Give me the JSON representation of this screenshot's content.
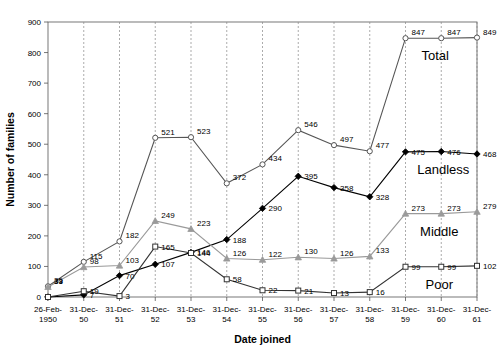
{
  "chart_data": {
    "type": "line",
    "title": "",
    "xlabel": "Date joined",
    "ylabel": "Number of families",
    "ylim": [
      0,
      900
    ],
    "ytick_step": 100,
    "yticks": [
      "0",
      "100",
      "200",
      "300",
      "400",
      "500",
      "600",
      "700",
      "800",
      "900"
    ],
    "grid": "vertical dashed gridlines at each category",
    "legend_position": "inline right, next to series end points",
    "categories": [
      "26-Feb-\n1950",
      "31-Dec-\n50",
      "31-Dec-\n51",
      "31-Dec-\n52",
      "31-Dec-\n53",
      "31-Dec-\n54",
      "31-Dec-\n55",
      "31-Dec-\n56",
      "31-Dec-\n57",
      "31-Dec-\n58",
      "31-Dec-\n59",
      "31-Dec-\n60",
      "31-Dec-\n61"
    ],
    "category_lines": [
      [
        "26-Feb-",
        "1950"
      ],
      [
        "31-Dec-",
        "50"
      ],
      [
        "31-Dec-",
        "51"
      ],
      [
        "31-Dec-",
        "52"
      ],
      [
        "31-Dec-",
        "53"
      ],
      [
        "31-Dec-",
        "54"
      ],
      [
        "31-Dec-",
        "55"
      ],
      [
        "31-Dec-",
        "56"
      ],
      [
        "31-Dec-",
        "57"
      ],
      [
        "31-Dec-",
        "58"
      ],
      [
        "31-Dec-",
        "59"
      ],
      [
        "31-Dec-",
        "60"
      ],
      [
        "31-Dec-",
        "61"
      ]
    ],
    "series": [
      {
        "name": "Total",
        "marker": "open-circle",
        "color": "#555555",
        "values": [
          35,
          115,
          182,
          521,
          523,
          372,
          434,
          546,
          497,
          477,
          847,
          847,
          849
        ],
        "labels": [
          "35",
          "115",
          "182",
          "521",
          "523",
          "372",
          "434",
          "546",
          "497",
          "477",
          "847",
          "847",
          "849"
        ]
      },
      {
        "name": "Landless",
        "marker": "filled-diamond",
        "color": "#000000",
        "values": [
          0,
          7,
          70,
          107,
          146,
          188,
          290,
          395,
          358,
          328,
          475,
          476,
          468
        ],
        "labels": [
          "",
          "7",
          "70",
          "107",
          "146",
          "188",
          "290",
          "395",
          "358",
          "328",
          "475",
          "476",
          "468"
        ]
      },
      {
        "name": "Middle",
        "marker": "filled-triangle",
        "color": "#9a9a9a",
        "values": [
          33,
          98,
          103,
          249,
          223,
          126,
          122,
          130,
          126,
          133,
          273,
          273,
          279
        ],
        "labels": [
          "33",
          "98",
          "103",
          "249",
          "223",
          "126",
          "122",
          "130",
          "126",
          "133",
          "273",
          "273",
          "279"
        ]
      },
      {
        "name": "Poor",
        "marker": "open-square",
        "color": "#333333",
        "values": [
          0,
          19,
          3,
          165,
          144,
          58,
          22,
          21,
          13,
          16,
          99,
          99,
          102
        ],
        "labels": [
          "",
          "19",
          "3",
          "165",
          "144",
          "58",
          "22",
          "21",
          "13",
          "16",
          "99",
          "99",
          "102"
        ]
      }
    ],
    "series_end_labels": [
      {
        "name": "Total",
        "text": "Total"
      },
      {
        "name": "Landless",
        "text": "Landless"
      },
      {
        "name": "Middle",
        "text": "Middle"
      },
      {
        "name": "Poor",
        "text": "Poor"
      }
    ]
  }
}
